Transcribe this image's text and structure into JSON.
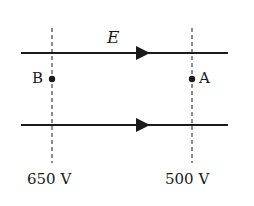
{
  "diagram": {
    "field_label": "E",
    "points": [
      {
        "name": "B",
        "potential": "650 V"
      },
      {
        "name": "A",
        "potential": "500 V"
      }
    ],
    "field_lines": 2,
    "field_direction": "left-to-right",
    "colors": {
      "ink": "#1a1a1a",
      "background": "#ffffff"
    }
  }
}
